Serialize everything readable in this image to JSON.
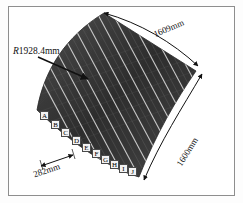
{
  "figure": {
    "background_color": "#ffffff",
    "border_color": "#8e8e8e",
    "panel_color_dark": "#3a3a3a",
    "panel_color_light": "#b9b9b9",
    "annotation_color": "#111111"
  },
  "dimensions": {
    "radius": {
      "prefix": "R",
      "value": "1928.4mm",
      "full": "R1928.4mm"
    },
    "top_edge": {
      "value": "1609mm"
    },
    "right_edge": {
      "value": "1600mm"
    },
    "pitch": {
      "value": "282mm"
    }
  },
  "points": [
    {
      "id": "A",
      "label": "A"
    },
    {
      "id": "B",
      "label": "B"
    },
    {
      "id": "C",
      "label": "C"
    },
    {
      "id": "D",
      "label": "D"
    },
    {
      "id": "E",
      "label": "E"
    },
    {
      "id": "F",
      "label": "F"
    },
    {
      "id": "G",
      "label": "G"
    },
    {
      "id": "H",
      "label": "H"
    },
    {
      "id": "I",
      "label": "I"
    },
    {
      "id": "J",
      "label": "J"
    }
  ]
}
